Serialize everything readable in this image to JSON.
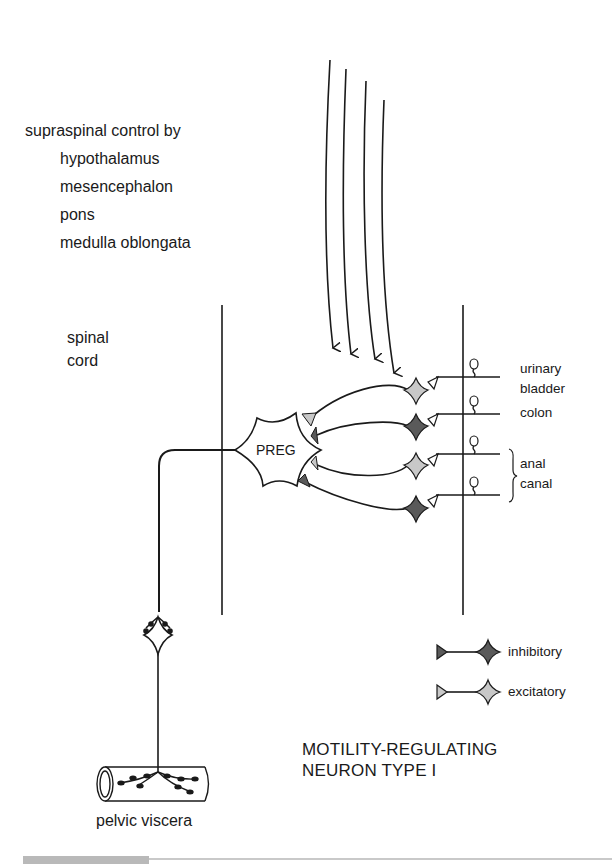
{
  "supraspinal": {
    "heading": "supraspinal control by",
    "centers": [
      "hypothalamus",
      "mesencephalon",
      "pons",
      "medulla oblongata"
    ]
  },
  "spinal_cord": {
    "line1": "spinal",
    "line2": "cord"
  },
  "preg_label": "PREG",
  "targets": {
    "urinary_bladder_1": "urinary",
    "urinary_bladder_2": "bladder",
    "colon": "colon",
    "anal_canal_1": "anal",
    "anal_canal_2": "canal"
  },
  "legend": {
    "inhibitory": {
      "label": "inhibitory",
      "color": "#5a5a5a"
    },
    "excitatory": {
      "label": "excitatory",
      "color": "#c8c8c8"
    }
  },
  "title": {
    "line1": "MOTILITY-REGULATING",
    "line2": "NEURON TYPE I"
  },
  "viscera_label": "pelvic viscera",
  "colors": {
    "ink": "#1a1a1a",
    "inhibitory": "#5a5a5a",
    "excitatory": "#c8c8c8"
  }
}
